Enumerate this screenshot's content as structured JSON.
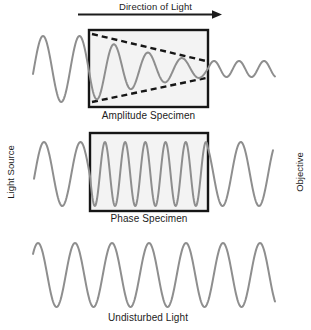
{
  "header": {
    "direction_label": "Direction of Light"
  },
  "side_labels": {
    "left": "Light Source",
    "right": "Objective"
  },
  "sections": {
    "amplitude": {
      "caption": "Amplitude Specimen"
    },
    "phase": {
      "caption": "Phase Specimen"
    },
    "undisturbed": {
      "caption": "Undisturbed Light"
    }
  },
  "colors": {
    "wave": "#8e8e8e",
    "ink": "#1c1c1c",
    "box_fill": "#f3f3f3",
    "box_border": "#161616"
  },
  "diagram": {
    "arrow": {
      "x1": 78,
      "x2": 222,
      "y": 14.5
    },
    "boxes": [
      {
        "name": "amplitude-specimen-box",
        "x": 89,
        "y": 30,
        "w": 119,
        "h": 77
      },
      {
        "name": "phase-specimen-box",
        "x": 90,
        "y": 133,
        "w": 118,
        "h": 78
      }
    ],
    "envelope_lines": [
      {
        "name": "amplitude-envelope-top",
        "x1": 92,
        "y1": 34,
        "x2": 206,
        "y2": 61
      },
      {
        "name": "amplitude-envelope-bottom",
        "x1": 92,
        "y1": 102,
        "x2": 206,
        "y2": 78
      }
    ],
    "waves": [
      {
        "name": "amplitude-wave",
        "cy": 69,
        "phi0": -0.15,
        "segments": [
          {
            "x0": 33,
            "x1": 90,
            "lambda": 36.5,
            "a0": 33,
            "a1": 33
          },
          {
            "x0": 90,
            "x1": 208,
            "lambda": 34,
            "a0": 33,
            "a1": 8
          },
          {
            "x0": 208,
            "x1": 275,
            "lambda": 25,
            "a0": 8,
            "a1": 8
          }
        ]
      },
      {
        "name": "phase-wave",
        "cy": 174,
        "phi0": -0.15,
        "segments": [
          {
            "x0": 34,
            "x1": 90,
            "lambda": 36.5,
            "a0": 32,
            "a1": 32
          },
          {
            "x0": 90,
            "x1": 208,
            "lambda": 20.2,
            "a0": 32,
            "a1": 32
          },
          {
            "x0": 208,
            "x1": 273,
            "lambda": 36.5,
            "a0": 32,
            "a1": 32
          }
        ]
      },
      {
        "name": "undisturbed-wave",
        "cy": 275,
        "phi0": 0.72,
        "segments": [
          {
            "x0": 33,
            "x1": 275,
            "lambda": 37,
            "a0": 32,
            "a1": 32
          }
        ]
      }
    ]
  }
}
